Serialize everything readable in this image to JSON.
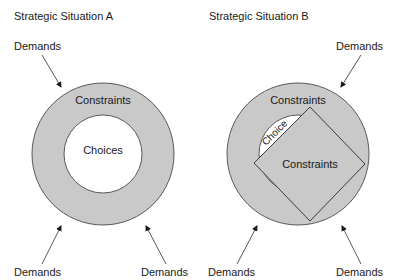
{
  "panels": [
    {
      "title": "Strategic Situation A",
      "outer_label": "Constraints",
      "inner_label": "Choices",
      "demands": [
        "Demands",
        "Demands",
        "Demands"
      ]
    },
    {
      "title": "Strategic Situation B",
      "outer_label": "Constraints",
      "inner_label": "Choice",
      "diamond_label": "Constraints",
      "demands": [
        "Demands",
        "Demands",
        "Demands"
      ]
    }
  ],
  "colors": {
    "constraint_fill": "#c9c9c9",
    "choice_fill": "#ffffff",
    "outline": "#4a4a4a"
  }
}
